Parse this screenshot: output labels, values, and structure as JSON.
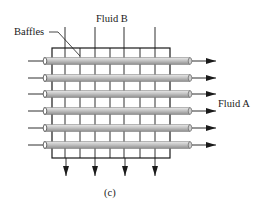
{
  "diagram": {
    "labels": {
      "fluid_b": "Fluid B",
      "fluid_a": "Fluid A",
      "baffles": "Baffles",
      "caption": "(c)"
    },
    "tubes": {
      "count": 6,
      "y_centers": [
        61,
        78,
        94,
        111,
        128,
        145
      ]
    },
    "colors": {
      "line": "#1a1a1a",
      "tube_light": "#e6e6e6",
      "tube_mid": "#bdbdbd",
      "tube_dark": "#8c8c8c"
    }
  }
}
